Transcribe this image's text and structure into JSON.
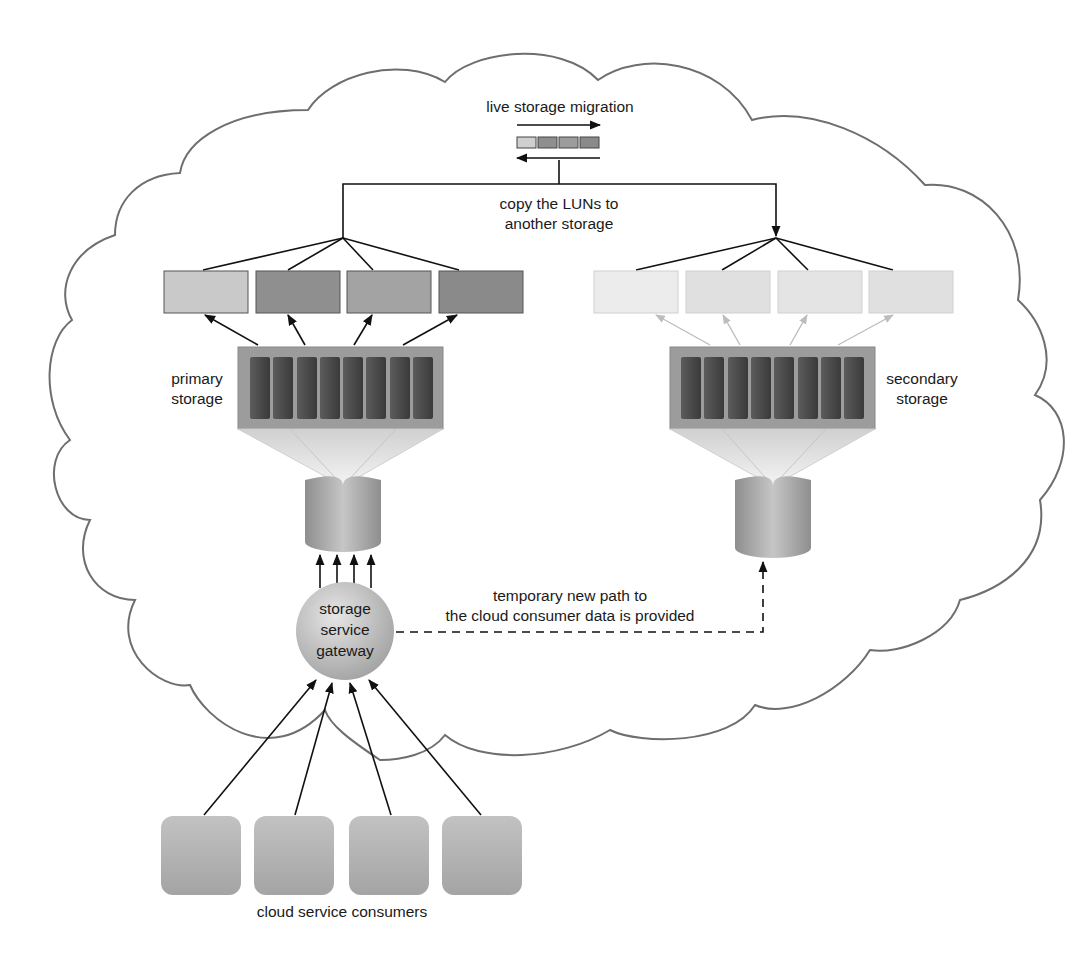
{
  "diagram": {
    "migration": {
      "title": "live storage migration",
      "copy_line1": "copy the LUNs to",
      "copy_line2": "another storage"
    },
    "primary_storage": {
      "label_line1": "primary",
      "label_line2": "storage",
      "lun_count": 4,
      "drive_count": 8
    },
    "secondary_storage": {
      "label_line1": "secondary",
      "label_line2": "storage",
      "lun_count": 4,
      "drive_count": 8
    },
    "gateway": {
      "line1": "storage",
      "line2": "service",
      "line3": "gateway"
    },
    "temporary_path": {
      "line1": "temporary new path to",
      "line2": "the cloud consumer data is provided"
    },
    "consumers": {
      "label": "cloud service consumers",
      "count": 4
    },
    "colors": {
      "cloud_outline": "#6e6e6e",
      "line": "#111111",
      "faded_line": "#bdbdbd",
      "primary_lun_1": "#c9c9c9",
      "primary_lun_2": "#8f8f8f",
      "primary_lun_3": "#a3a3a3",
      "primary_lun_4": "#8a8a8a",
      "secondary_lun": "#e3e3e3",
      "array_frame": "#9a9a9a",
      "drive": "#4a4a4a",
      "cylinder": "#a8a8a8",
      "gateway": "#c4c4c4",
      "consumer": "#b3b3b3"
    }
  }
}
